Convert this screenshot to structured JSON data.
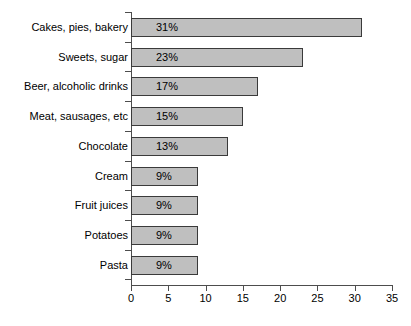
{
  "chart_data": {
    "type": "bar",
    "orientation": "horizontal",
    "title": "",
    "xlabel": "",
    "ylabel": "",
    "xlim": [
      0,
      35
    ],
    "xticks": [
      "0",
      "5",
      "10",
      "15",
      "20",
      "25",
      "30",
      "35"
    ],
    "grid": false,
    "legend": null,
    "bar_color": "#bfbfbf",
    "bar_border_color": "#3a3a3a",
    "categories": [
      "Cakes, pies, bakery",
      "Sweets, sugar",
      "Beer, alcoholic drinks",
      "Meat, sausages, etc",
      "Chocolate",
      "Cream",
      "Fruit juices",
      "Potatoes",
      "Pasta"
    ],
    "values": [
      31,
      23,
      17,
      15,
      13,
      9,
      9,
      9,
      9
    ],
    "data_labels": [
      "31%",
      "23%",
      "17%",
      "15%",
      "13%",
      "9%",
      "9%",
      "9%",
      "9%"
    ]
  }
}
